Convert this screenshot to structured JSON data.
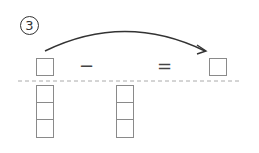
{
  "problem": {
    "number_label": "3",
    "operator_minus": "−",
    "operator_equals": "="
  },
  "diagram": {
    "arrow": {
      "from": "left-answer-box",
      "to": "result-box"
    },
    "left_column_boxes": 3,
    "middle_column_boxes": 3,
    "colors": {
      "box_border": "#8a8a8a",
      "arrow": "#333333",
      "dashed_line": "#aaaaaa"
    }
  }
}
